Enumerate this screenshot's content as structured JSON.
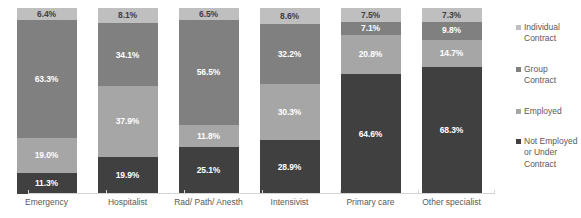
{
  "chart_data": {
    "type": "bar",
    "subtype": "stacked-100-percent",
    "title": "",
    "subtitle": "",
    "xlabel": "",
    "ylabel": "",
    "ylim": [
      0,
      100
    ],
    "grid": false,
    "legend_position": "right",
    "value_suffix": "%",
    "stack_order_top_to_bottom": [
      "Individual Contract",
      "Group Contract",
      "Employed",
      "Not Employed or Under Contract"
    ],
    "categories": [
      "Emergency",
      "Hospitalist",
      "Rad/ Path/ Anesth",
      "Intensivist",
      "Primary care",
      "Other specialist"
    ],
    "series": [
      {
        "name": "Individual Contract",
        "color": "#bfbfbf",
        "values": [
          6.4,
          8.1,
          6.5,
          8.6,
          7.5,
          7.3
        ],
        "labels": [
          "6.4%",
          "8.1%",
          "6.5%",
          "8.6%",
          "7.5%",
          "7.3%"
        ]
      },
      {
        "name": "Group Contract",
        "color": "#808080",
        "values": [
          63.3,
          34.1,
          56.5,
          32.2,
          7.1,
          9.8
        ],
        "labels": [
          "63.3%",
          "34.1%",
          "56.5%",
          "32.2%",
          "7.1%",
          "9.8%"
        ]
      },
      {
        "name": "Employed",
        "color": "#a6a6a6",
        "values": [
          19.0,
          37.9,
          11.8,
          30.3,
          20.8,
          14.7
        ],
        "labels": [
          "19.0%",
          "37.9%",
          "11.8%",
          "30.3%",
          "20.8%",
          "14.7%"
        ]
      },
      {
        "name": "Not Employed or Under Contract",
        "color": "#404040",
        "values": [
          11.3,
          19.9,
          25.1,
          28.9,
          64.6,
          68.3
        ],
        "labels": [
          "11.3%",
          "19.9%",
          "25.1%",
          "28.9%",
          "64.6%",
          "68.3%"
        ]
      }
    ]
  },
  "legend": {
    "items": [
      {
        "label": "Individual Contract",
        "color": "#bfbfbf"
      },
      {
        "label": "Group Contract",
        "color": "#808080"
      },
      {
        "label": "Employed",
        "color": "#a6a6a6"
      },
      {
        "label": "Not Employed or Under Contract",
        "color": "#404040"
      }
    ]
  },
  "axis": {
    "baseline_color": "#d4d4d4"
  }
}
